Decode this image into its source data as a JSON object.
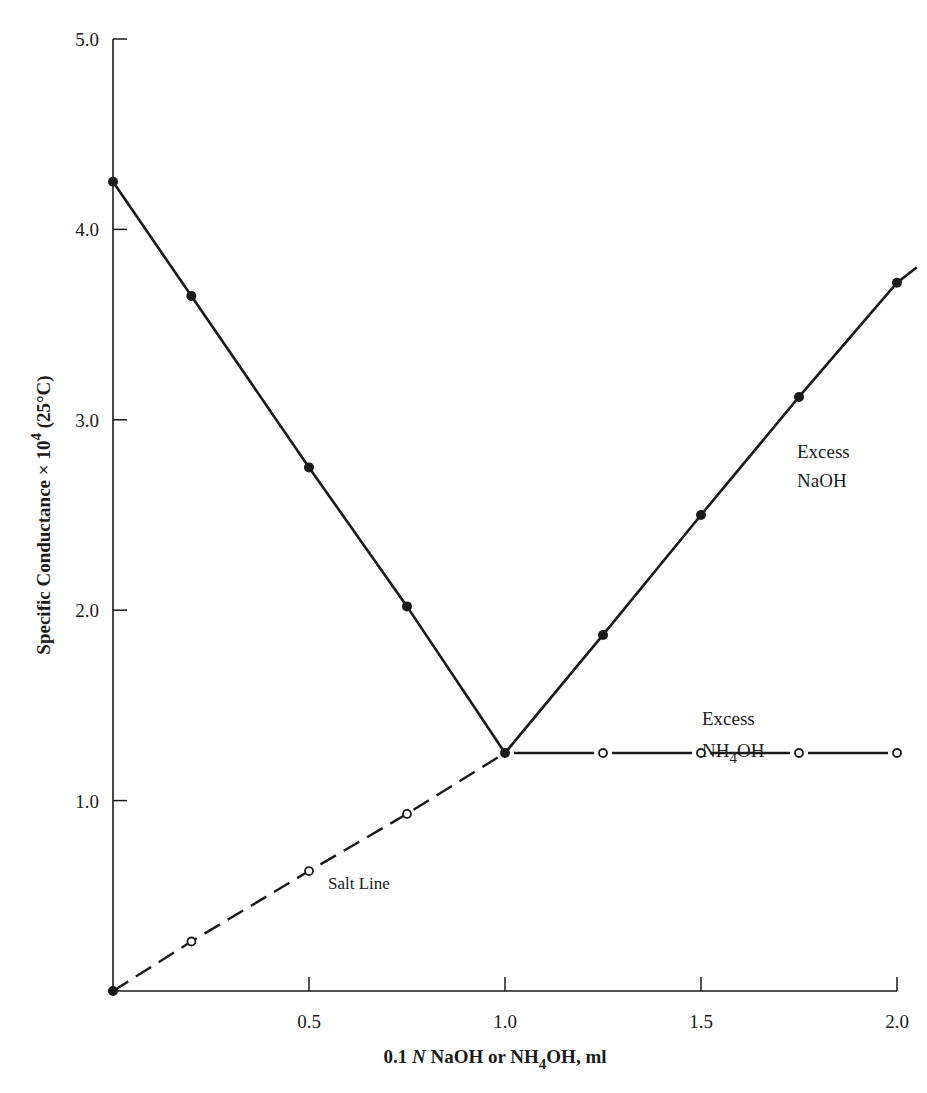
{
  "chart_data": {
    "type": "line",
    "title": "",
    "xlabel": "0.1 N NaOH or NH4OH, ml",
    "xlabel_parts": {
      "pre": "0.1 ",
      "italic": "N",
      "mid": " NaOH or NH",
      "sub": "4",
      "post": "OH, ml"
    },
    "ylabel": "Specific Conductance × 10^4 (25°C)",
    "ylabel_parts": {
      "pre": "Specific Conductance × 10",
      "sup": "4",
      "post": " (25°C)"
    },
    "xlim": [
      0,
      2.0
    ],
    "ylim": [
      0,
      5.0
    ],
    "x_ticks": [
      0.5,
      1.0,
      1.5,
      2.0
    ],
    "x_tick_labels": [
      "0.5",
      "1.0",
      "1.5",
      "2.0"
    ],
    "y_ticks": [
      1.0,
      2.0,
      3.0,
      4.0,
      5.0
    ],
    "y_tick_labels": [
      "1.0",
      "2.0",
      "3.0",
      "4.0",
      "5.0"
    ],
    "grid": false,
    "legend": null,
    "series": [
      {
        "name": "NaOH titration",
        "style": "solid",
        "marker": "filled-circle",
        "x": [
          0,
          0.2,
          0.5,
          0.75,
          1.0,
          1.25,
          1.5,
          1.75,
          2.0
        ],
        "y": [
          4.25,
          3.65,
          2.75,
          2.02,
          1.25,
          1.87,
          2.5,
          3.12,
          3.72
        ],
        "line_extends_to": [
          2.05,
          3.8
        ]
      },
      {
        "name": "Salt Line (NH4OH)",
        "style": "dashed",
        "marker": "open-circle",
        "x": [
          0,
          0.2,
          0.5,
          0.75,
          1.0
        ],
        "y": [
          0,
          0.26,
          0.63,
          0.93,
          1.25
        ]
      },
      {
        "name": "Excess NH4OH",
        "style": "solid-broken",
        "marker": "open-circle",
        "x": [
          1.0,
          1.25,
          1.5,
          1.75,
          2.0
        ],
        "y": [
          1.25,
          1.25,
          1.25,
          1.25,
          1.25
        ]
      }
    ],
    "annotations": [
      {
        "text": "Excess NaOH",
        "lines": [
          "Excess",
          "NaOH"
        ],
        "x": 1.7,
        "y": 2.85
      },
      {
        "text": "Excess NH4OH",
        "lines": [
          "Excess",
          "NH",
          "4",
          "OH"
        ],
        "x": 1.4,
        "y": 1.45
      },
      {
        "text": "Salt Line",
        "x": 0.58,
        "y": 0.55
      }
    ]
  },
  "labels": {
    "annot_naoh_1": "Excess",
    "annot_naoh_2": "NaOH",
    "annot_nh4_1": "Excess",
    "annot_nh4_2a": "NH",
    "annot_nh4_2sub": "4",
    "annot_nh4_2b": "OH",
    "salt_line": "Salt Line"
  }
}
